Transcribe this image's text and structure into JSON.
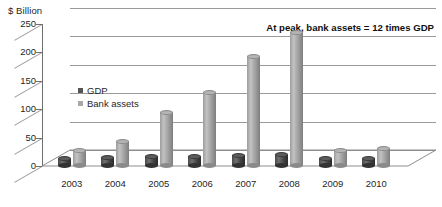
{
  "chart_data": {
    "type": "bar",
    "title": "",
    "subtitle": "",
    "xlabel": "",
    "ylabel": "$ Billion",
    "categories": [
      "2003",
      "2004",
      "2005",
      "2006",
      "2007",
      "2008",
      "2009",
      "2010"
    ],
    "series": [
      {
        "name": "GDP",
        "color": "#555555",
        "values": [
          13,
          15,
          17,
          17,
          19,
          20,
          13,
          14
        ]
      },
      {
        "name": "Bank assets",
        "color": "#a8a8a8",
        "values": [
          28,
          44,
          95,
          130,
          192,
          235,
          28,
          30
        ]
      }
    ],
    "ylim": [
      0,
      250
    ],
    "yticks": [
      0,
      50,
      100,
      150,
      200,
      250
    ],
    "ytick_labels": [
      "0",
      "50",
      "100",
      "150",
      "200",
      "250"
    ],
    "grid": true,
    "grid_axis": "y",
    "legend_position": "inside-upper-left",
    "annotations": [
      {
        "text": "At peak, bank assets = 12 times GDP",
        "position": "top-right",
        "bold": true
      }
    ],
    "style": "3d-cylinder"
  },
  "axis": {
    "y_title": "$ Billion"
  },
  "legend": {
    "items": [
      {
        "label": "GDP"
      },
      {
        "label": "Bank assets"
      }
    ]
  },
  "annotation": {
    "text": "At peak, bank assets = 12 times GDP"
  }
}
